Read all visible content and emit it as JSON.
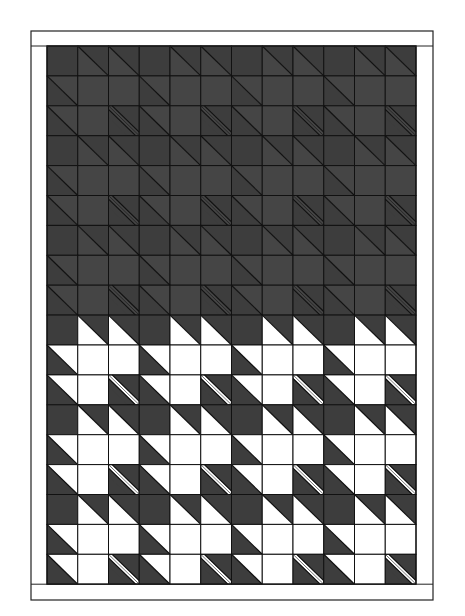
{
  "figure": {
    "type": "quilt-diagram",
    "rows": 18,
    "cols": 12,
    "frame": {
      "x": 31,
      "y": 31,
      "width": 402,
      "height": 569,
      "border_top": 15,
      "border_bottom": 16,
      "border_left": 16,
      "border_right": 17
    },
    "grid": {
      "x": 47,
      "y": 46,
      "cell_w": 30.75,
      "cell_h": 29.9
    },
    "colors": {
      "background": "#ffffff",
      "dark": "#3d3d3d",
      "dark_alt": "#454545",
      "light": "#ffffff",
      "line": "#111111"
    },
    "legend_cell_types": {
      "D": "solid dark square",
      "W": "solid white square",
      "LW": "diagonal; lower-left triangle light, upper-right dark",
      "UW": "diagonal; upper-right triangle light, lower-left dark",
      "S": "dark square with light diagonal stripe"
    },
    "sections": [
      {
        "name": "top-dark-section",
        "row_start": 0,
        "row_end": 9,
        "light_color_key": "dark_alt"
      },
      {
        "name": "bottom-light-section",
        "row_start": 9,
        "row_end": 18,
        "light_color_key": "light"
      }
    ],
    "row_pattern": [
      [
        "D",
        "LW",
        "LW"
      ],
      [
        "UW",
        "W",
        "W"
      ],
      [
        "UW",
        "W",
        "S"
      ]
    ]
  }
}
